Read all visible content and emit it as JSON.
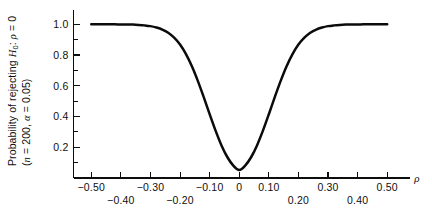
{
  "chart_data": {
    "type": "line",
    "title": "",
    "xlabel": "ρ",
    "ylabel_line1": "Probability of rejecting H₀: ρ = 0",
    "ylabel_line2": "(n = 200, α = 0.05)",
    "xlim": [
      -0.56,
      0.56
    ],
    "ylim": [
      0.0,
      1.08
    ],
    "grid": false,
    "legend": null,
    "x_major_ticks": [
      -0.5,
      -0.4,
      -0.3,
      -0.2,
      -0.1,
      0,
      0.1,
      0.2,
      0.3,
      0.4,
      0.5
    ],
    "x_tick_labels_upper": [
      {
        "value": -0.5,
        "text": "−0.50"
      },
      {
        "value": -0.3,
        "text": "−0.30"
      },
      {
        "value": -0.1,
        "text": "−0.10"
      },
      {
        "value": 0,
        "text": "0"
      },
      {
        "value": 0.1,
        "text": "0.10"
      },
      {
        "value": 0.3,
        "text": "0.30"
      },
      {
        "value": 0.5,
        "text": "0.50"
      }
    ],
    "x_tick_labels_lower": [
      {
        "value": -0.4,
        "text": "−0.40"
      },
      {
        "value": -0.2,
        "text": "−0.20"
      },
      {
        "value": 0.2,
        "text": "0.20"
      },
      {
        "value": 0.4,
        "text": "0.40"
      }
    ],
    "y_major_ticks": [
      0.2,
      0.4,
      0.6,
      0.8,
      1.0
    ],
    "y_tick_labels": [
      "0.2",
      "0.4",
      "0.6",
      "0.8",
      "1.0"
    ],
    "y_minor_ticks": [
      0.1,
      0.3,
      0.5,
      0.7,
      0.9,
      1.1
    ],
    "series": [
      {
        "name": "Power curve",
        "color": "#0b0b0b",
        "x": [
          -0.5,
          -0.48,
          -0.46,
          -0.44,
          -0.42,
          -0.4,
          -0.38,
          -0.36,
          -0.34,
          -0.32,
          -0.3,
          -0.28,
          -0.26,
          -0.24,
          -0.22,
          -0.2,
          -0.18,
          -0.16,
          -0.14,
          -0.12,
          -0.1,
          -0.08,
          -0.06,
          -0.04,
          -0.02,
          0.0,
          0.02,
          0.04,
          0.06,
          0.08,
          0.1,
          0.12,
          0.14,
          0.16,
          0.18,
          0.2,
          0.22,
          0.24,
          0.26,
          0.28,
          0.3,
          0.32,
          0.34,
          0.36,
          0.38,
          0.4,
          0.42,
          0.44,
          0.46,
          0.48,
          0.5
        ],
        "values": [
          1.0,
          1.0,
          1.0,
          1.0,
          1.0,
          0.999,
          0.999,
          0.998,
          0.996,
          0.993,
          0.988,
          0.979,
          0.966,
          0.945,
          0.913,
          0.868,
          0.806,
          0.727,
          0.632,
          0.526,
          0.415,
          0.308,
          0.212,
          0.135,
          0.081,
          0.052,
          0.081,
          0.135,
          0.212,
          0.308,
          0.415,
          0.526,
          0.632,
          0.727,
          0.806,
          0.868,
          0.913,
          0.945,
          0.966,
          0.979,
          0.988,
          0.993,
          0.996,
          0.998,
          0.999,
          0.999,
          1.0,
          1.0,
          1.0,
          1.0,
          1.0
        ]
      }
    ],
    "annotations": {
      "minimum_value": 0.05,
      "minimum_at": 0,
      "sample_size": 200,
      "alpha": 0.05
    }
  }
}
